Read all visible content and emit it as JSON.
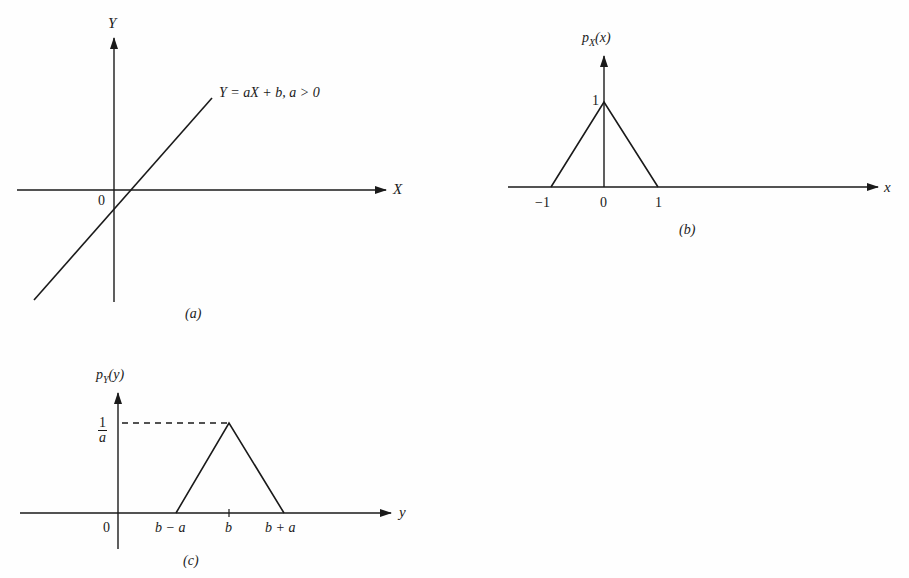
{
  "figure": {
    "panels": [
      {
        "id": "a",
        "caption": "(a)",
        "x_axis_label": "X",
        "y_axis_label": "Y",
        "origin_label": "0",
        "line_label": "Y = aX + b, a > 0"
      },
      {
        "id": "b",
        "caption": "(b)",
        "x_axis_label": "x",
        "y_axis_label_main": "p",
        "y_axis_label_sub": "X",
        "y_axis_label_arg": "(x)",
        "peak_label": "1",
        "ticks": [
          "−1",
          "0",
          "1"
        ]
      },
      {
        "id": "c",
        "caption": "(c)",
        "x_axis_label": "y",
        "y_axis_label_main": "p",
        "y_axis_label_sub": "Y",
        "y_axis_label_arg": "(y)",
        "peak_label_num": "1",
        "peak_label_den": "a",
        "ticks": [
          "0",
          "b − a",
          "b",
          "b + a"
        ]
      }
    ]
  },
  "colors": {
    "ink": "#1a1a1a",
    "background": "#fefefe"
  }
}
